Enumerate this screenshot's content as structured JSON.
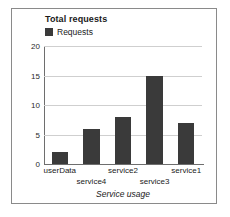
{
  "panel": {
    "border_color": "#8a8a8a",
    "background": "#ffffff"
  },
  "chart_data": {
    "type": "bar",
    "title": "Total requests",
    "xlabel": "Service usage",
    "ylabel": "",
    "categories": [
      "userData",
      "service4",
      "service2",
      "service3",
      "service1"
    ],
    "values": [
      2,
      6,
      8,
      15,
      7
    ],
    "series": [
      {
        "name": "Requests",
        "values": [
          2,
          6,
          8,
          15,
          7
        ]
      }
    ],
    "ylim": [
      0,
      20
    ],
    "yticks": [
      0,
      5,
      10,
      15,
      20
    ],
    "ytick_labels": [
      "0",
      "5",
      "10",
      "15",
      "20"
    ],
    "grid": true,
    "legend": {
      "position": "top-left",
      "entries": [
        {
          "label": "Requests",
          "color": "#3a3a3a",
          "marker": "square"
        }
      ]
    },
    "bar_color": "#3a3a3a",
    "gridline_color": "#cfcfcf",
    "axis_color": "#6e6e6e",
    "label_rows": [
      0,
      1,
      0,
      1,
      0
    ]
  }
}
